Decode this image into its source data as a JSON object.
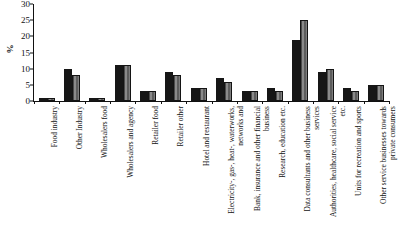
{
  "chart_data": {
    "type": "bar",
    "title": "",
    "xlabel": "",
    "ylabel": "%",
    "ylim": [
      0,
      30
    ],
    "yticks": [
      0,
      5,
      10,
      15,
      20,
      25,
      30
    ],
    "grid": false,
    "legend": "none",
    "categories": [
      "Food industry",
      "Other Industry",
      "Wholesalers food",
      "Wholesalers and agency",
      "Retailer food",
      "Retailer other",
      "Hotel and restaurant",
      "Electricity-, gas-, heat-, waterworks, networks and",
      "Bank, insurance and other financial business",
      "Research, education etc.",
      "Data consultants and other business services",
      "Authorities, healthcare, social service etc.",
      "Units for recreation and sports",
      "Other service businesses towards private consumers"
    ],
    "series": [
      {
        "name": "series-1",
        "color": "#161616",
        "values": [
          1,
          10,
          1,
          11,
          3,
          9,
          4,
          7,
          3,
          4,
          19,
          9,
          4,
          5
        ]
      },
      {
        "name": "series-2",
        "color": "#6e6e6e",
        "values": [
          1,
          8,
          1,
          11,
          3,
          8,
          4,
          6,
          3,
          3,
          25,
          10,
          3,
          5
        ]
      }
    ]
  }
}
